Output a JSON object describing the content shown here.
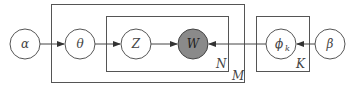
{
  "diagram": {
    "type": "plate-notation",
    "nodes": [
      {
        "id": "alpha",
        "label": "α",
        "cx": 25,
        "cy": 44,
        "observed": false
      },
      {
        "id": "theta",
        "label": "θ",
        "cx": 80,
        "cy": 44,
        "observed": false
      },
      {
        "id": "z",
        "label": "Z",
        "cx": 136,
        "cy": 44,
        "observed": false
      },
      {
        "id": "w",
        "label": "W",
        "cx": 193,
        "cy": 44,
        "observed": true
      },
      {
        "id": "phi",
        "label": "ϕ",
        "sub": "k",
        "cx": 281,
        "cy": 44,
        "observed": false
      },
      {
        "id": "beta",
        "label": "β",
        "cx": 330,
        "cy": 44,
        "observed": false
      }
    ],
    "edges": [
      {
        "from": "alpha",
        "to": "theta"
      },
      {
        "from": "theta",
        "to": "z"
      },
      {
        "from": "z",
        "to": "w"
      },
      {
        "from": "phi",
        "to": "w"
      },
      {
        "from": "beta",
        "to": "phi"
      }
    ],
    "plates": [
      {
        "id": "M",
        "label": "M"
      },
      {
        "id": "N",
        "label": "N"
      },
      {
        "id": "K",
        "label": "K"
      }
    ],
    "colors": {
      "observed_fill": "#8a8a8a",
      "stroke": "#555555"
    }
  }
}
